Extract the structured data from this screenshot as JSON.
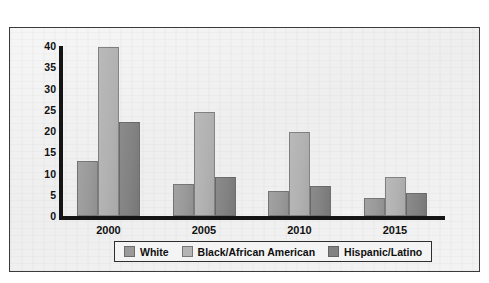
{
  "chart_data": {
    "type": "bar",
    "title": "",
    "subtitle": "",
    "xlabel": "",
    "ylabel": "",
    "categories": [
      "2000",
      "2005",
      "2010",
      "2015"
    ],
    "series": [
      {
        "name": "White",
        "color": "#9a9a9a",
        "values": [
          13,
          7.5,
          6,
          4.3
        ]
      },
      {
        "name": "Black/African American",
        "color": "#b4b4b4",
        "values": [
          39.7,
          24.5,
          19.7,
          9.2
        ]
      },
      {
        "name": "Hispanic/Latino",
        "color": "#828282",
        "values": [
          22.1,
          9.1,
          7,
          5.4
        ]
      }
    ],
    "ylim": [
      0,
      40
    ],
    "ytick_step": 5,
    "yticks": [
      "40",
      "35",
      "30",
      "25",
      "20",
      "15",
      "10",
      "5",
      "0"
    ],
    "grid": false,
    "legend_position": "bottom",
    "legend_entries": [
      "White",
      "Black/African American",
      "Hispanic/Latino"
    ],
    "axis_color": "#141414",
    "plot_background": "#f1f1f1",
    "frame_color": "#3a3a3a"
  }
}
